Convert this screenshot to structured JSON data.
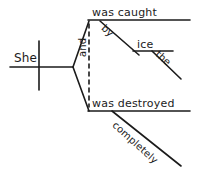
{
  "diagram": {
    "type": "reed-kellogg-sentence-diagram",
    "sentence": "She was caught by the ice and was destroyed completely",
    "ink_color": "#1b1b1b",
    "background_color": "#ffffff",
    "nodes": {
      "subject": "She",
      "predicate_upper": "was caught",
      "predicate_lower": "was destroyed",
      "conjunction": "and",
      "preposition": "by",
      "object_of_preposition": "ice",
      "article": "the",
      "adverb": "completely"
    },
    "lines": {
      "subject_baseline": "horizontal",
      "subject_verb_divider": "vertical",
      "conjunction_connector": "dashed-vertical",
      "upper_branch": "diagonal",
      "lower_branch": "diagonal",
      "preposition_slant": "diagonal",
      "object_line": "horizontal",
      "article_slant": "diagonal",
      "adverb_slant": "diagonal"
    }
  }
}
